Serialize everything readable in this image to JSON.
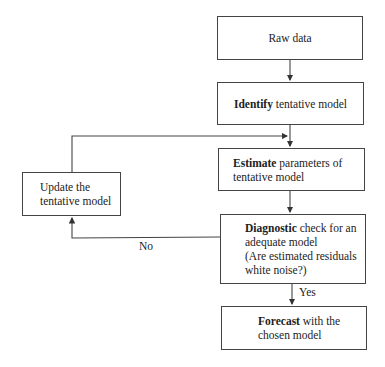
{
  "diagram": {
    "nodes": {
      "raw_data": {
        "text": "Raw data"
      },
      "identify": {
        "bold": "Identify",
        "text": " tentative model"
      },
      "estimate": {
        "bold": "Estimate",
        "line1": " parameters of",
        "line2": "tentative model"
      },
      "diagnostic": {
        "bold": "Diagnostic",
        "line1": " check for an",
        "line2": "adequate model",
        "line3": "(Are estimated residuals",
        "line4": "white noise?)"
      },
      "forecast": {
        "bold": "Forecast",
        "line1": " with the",
        "line2": "chosen model"
      },
      "update": {
        "line1": "Update the",
        "line2": "tentative model"
      }
    },
    "edge_labels": {
      "no": "No",
      "yes": "Yes"
    }
  }
}
